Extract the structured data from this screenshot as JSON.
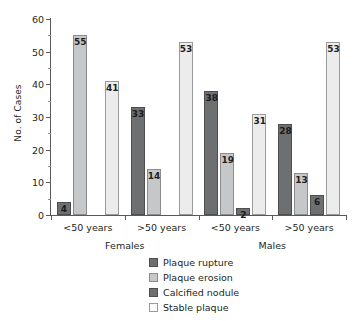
{
  "chart_data": {
    "type": "bar",
    "title": "",
    "xlabel": "",
    "ylabel": "No. of Cases",
    "ylim": [
      0,
      60
    ],
    "ytick_labels": [
      "0",
      "10",
      "20",
      "30",
      "40",
      "50",
      "60"
    ],
    "ytick_values": [
      0,
      10,
      20,
      30,
      40,
      50,
      60
    ],
    "minor_tick_step": 5,
    "grid": false,
    "legend_position": "bottom-center",
    "categories": [
      "<50 years",
      ">50 years",
      "<50 years",
      ">50 years"
    ],
    "group_labels": [
      "Females",
      "Males"
    ],
    "series": [
      {
        "name": "Plaque rupture",
        "color": "#6e6f71",
        "values": [
          4,
          33,
          38,
          28
        ]
      },
      {
        "name": "Plaque erosion",
        "color": "#c6c7c9",
        "values": [
          55,
          14,
          19,
          13
        ]
      },
      {
        "name": "Calcified nodule",
        "color": "#6e6f71",
        "values": [
          0,
          0,
          2,
          6
        ]
      },
      {
        "name": "Stable plaque",
        "color": "#ececec",
        "values": [
          41,
          53,
          31,
          53
        ]
      }
    ],
    "value_labels": [
      [
        "4",
        "55",
        "",
        "41"
      ],
      [
        "33",
        "14",
        "",
        "53"
      ],
      [
        "38",
        "19",
        "2",
        "31"
      ],
      [
        "28",
        "13",
        "6",
        "53"
      ]
    ]
  },
  "legend": {
    "items": [
      {
        "label": "Plaque rupture"
      },
      {
        "label": "Plaque erosion"
      },
      {
        "label": "Calcified nodule"
      },
      {
        "label": "Stable plaque"
      }
    ]
  }
}
